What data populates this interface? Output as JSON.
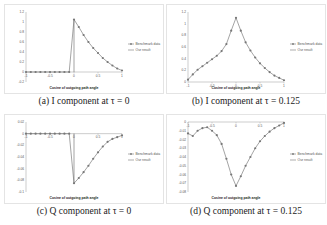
{
  "captions": {
    "a": "(a) I component at τ = 0",
    "b": "(b) I component at τ = 0.125",
    "c": "(c) Q component at τ = 0",
    "d": "(d) Q component at τ = 0.125"
  },
  "chart_data": [
    {
      "id": "a",
      "type": "line",
      "title": "(a) I component at τ = 0",
      "xlabel": "Cosine of outgoing path angle",
      "ylabel": "",
      "xlim": [
        -1,
        1
      ],
      "ylim": [
        -0.2,
        1.2
      ],
      "xticks": [
        "-1",
        "-0.5",
        "0",
        "0.5",
        "1"
      ],
      "yticks": [
        "1.2",
        "1",
        "0.8",
        "0.6",
        "0.4",
        "0.2",
        "0",
        "-0.2"
      ],
      "legend": [
        "Benchmark data",
        "Our result"
      ],
      "legend_position": "right",
      "x": [
        -1,
        -0.9,
        -0.8,
        -0.7,
        -0.6,
        -0.5,
        -0.4,
        -0.3,
        -0.2,
        -0.1,
        0,
        0.1,
        0.2,
        0.3,
        0.4,
        0.5,
        0.6,
        0.7,
        0.8,
        0.9,
        1
      ],
      "series": [
        {
          "name": "Benchmark data",
          "values": [
            0,
            0,
            0,
            0,
            0,
            0,
            0,
            0,
            0,
            0,
            1.05,
            0.9,
            0.74,
            0.6,
            0.48,
            0.38,
            0.28,
            0.2,
            0.13,
            0.07,
            0.03
          ]
        },
        {
          "name": "Our result",
          "values": [
            0,
            0,
            0,
            0,
            0,
            0,
            0,
            0,
            0,
            0,
            1.05,
            0.9,
            0.74,
            0.6,
            0.48,
            0.38,
            0.28,
            0.2,
            0.13,
            0.07,
            0.03
          ]
        }
      ]
    },
    {
      "id": "b",
      "type": "line",
      "title": "(b) I component at τ = 0.125",
      "xlabel": "Cosine of outgoing path angle",
      "ylabel": "",
      "xlim": [
        -1,
        1
      ],
      "ylim": [
        0,
        1.2
      ],
      "xticks": [
        "-1",
        "-0.5",
        "0",
        "0.5",
        "1"
      ],
      "yticks": [
        "1.2",
        "1",
        "0.8",
        "0.6",
        "0.4",
        "0.2",
        "0"
      ],
      "legend": [
        "Benchmark data",
        "Our result"
      ],
      "legend_position": "right",
      "x": [
        -1,
        -0.9,
        -0.8,
        -0.7,
        -0.6,
        -0.5,
        -0.4,
        -0.3,
        -0.2,
        -0.1,
        0,
        0.1,
        0.2,
        0.3,
        0.4,
        0.5,
        0.6,
        0.7,
        0.8,
        0.9,
        1
      ],
      "series": [
        {
          "name": "Benchmark data",
          "values": [
            0.04,
            0.13,
            0.21,
            0.27,
            0.33,
            0.39,
            0.45,
            0.53,
            0.65,
            0.88,
            1.1,
            0.88,
            0.68,
            0.54,
            0.42,
            0.32,
            0.24,
            0.17,
            0.11,
            0.07,
            0.03
          ]
        },
        {
          "name": "Our result",
          "values": [
            0.04,
            0.13,
            0.21,
            0.27,
            0.33,
            0.39,
            0.45,
            0.53,
            0.65,
            0.88,
            1.1,
            0.88,
            0.68,
            0.54,
            0.42,
            0.32,
            0.24,
            0.17,
            0.11,
            0.07,
            0.03
          ]
        }
      ]
    },
    {
      "id": "c",
      "type": "line",
      "title": "(c) Q component at τ = 0",
      "xlabel": "Cosine of outgoing path angle",
      "ylabel": "",
      "xlim": [
        -1,
        1
      ],
      "ylim": [
        -0.1,
        0.02
      ],
      "xticks": [
        "-1",
        "-0.5",
        "0",
        "0.5",
        "1"
      ],
      "yticks": [
        "0.02",
        "0",
        "-0.02",
        "-0.04",
        "-0.06",
        "-0.08",
        "-0.1"
      ],
      "legend": [
        "Benchmark data",
        "Our result"
      ],
      "legend_position": "right",
      "x": [
        -1,
        -0.9,
        -0.8,
        -0.7,
        -0.6,
        -0.5,
        -0.4,
        -0.3,
        -0.2,
        -0.1,
        0,
        0.1,
        0.2,
        0.3,
        0.4,
        0.5,
        0.6,
        0.7,
        0.8,
        0.9,
        1
      ],
      "series": [
        {
          "name": "Benchmark data",
          "values": [
            0,
            0,
            0,
            0,
            0,
            0,
            0,
            0,
            0,
            0,
            -0.085,
            -0.076,
            -0.066,
            -0.055,
            -0.043,
            -0.032,
            -0.022,
            -0.014,
            -0.009,
            -0.006,
            -0.003
          ]
        },
        {
          "name": "Our result",
          "values": [
            0,
            0,
            0,
            0,
            0,
            0,
            0,
            0,
            0,
            0,
            -0.085,
            -0.076,
            -0.066,
            -0.055,
            -0.043,
            -0.032,
            -0.022,
            -0.014,
            -0.009,
            -0.006,
            -0.003
          ]
        }
      ]
    },
    {
      "id": "d",
      "type": "line",
      "title": "(d) Q component at τ = 0.125",
      "xlabel": "Cosine of outgoing path angle",
      "ylabel": "",
      "xlim": [
        -1,
        1
      ],
      "ylim": [
        -0.08,
        0
      ],
      "xticks": [
        "-1",
        "-0.5",
        "0",
        "0.5",
        "1"
      ],
      "yticks": [
        "0",
        "-0.01",
        "-0.02",
        "-0.03",
        "-0.04",
        "-0.05",
        "-0.06",
        "-0.07",
        "-0.08"
      ],
      "legend": [
        "Benchmark data",
        "Our result"
      ],
      "legend_position": "right",
      "x": [
        -1,
        -0.9,
        -0.8,
        -0.7,
        -0.6,
        -0.5,
        -0.4,
        -0.3,
        -0.2,
        -0.1,
        0,
        0.1,
        0.2,
        0.3,
        0.4,
        0.5,
        0.6,
        0.7,
        0.8,
        0.9,
        1
      ],
      "series": [
        {
          "name": "Benchmark data",
          "values": [
            -0.013,
            -0.016,
            -0.01,
            -0.007,
            -0.006,
            -0.01,
            -0.015,
            -0.025,
            -0.042,
            -0.06,
            -0.073,
            -0.062,
            -0.05,
            -0.04,
            -0.03,
            -0.022,
            -0.016,
            -0.011,
            -0.007,
            -0.004,
            -0.001
          ]
        },
        {
          "name": "Our result",
          "values": [
            -0.013,
            -0.016,
            -0.01,
            -0.007,
            -0.006,
            -0.01,
            -0.015,
            -0.025,
            -0.042,
            -0.06,
            -0.073,
            -0.062,
            -0.05,
            -0.04,
            -0.03,
            -0.022,
            -0.016,
            -0.011,
            -0.007,
            -0.004,
            -0.001
          ]
        }
      ]
    }
  ]
}
